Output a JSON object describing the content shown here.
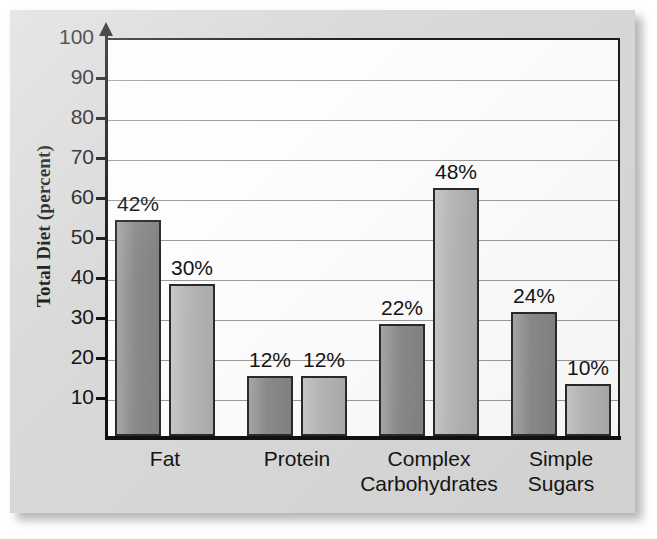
{
  "figure": {
    "background_color": "#d9d9d9",
    "plot_background_color": "#fdfdfd",
    "axis_color": "#111111",
    "grid_color": "#9a9a9a"
  },
  "chart_data": {
    "type": "bar",
    "title": "",
    "xlabel": "",
    "ylabel": "Total Diet (percent)",
    "ylim": [
      0,
      100
    ],
    "yticks": [
      10,
      20,
      30,
      40,
      50,
      60,
      70,
      80,
      90,
      100
    ],
    "ytick_labels": [
      "10",
      "20",
      "30",
      "40",
      "50",
      "60",
      "70",
      "80",
      "90",
      "100"
    ],
    "grid": true,
    "legend": "none",
    "categories": [
      "Fat",
      "Protein",
      "Complex Carbohydrates",
      "Simple Sugars"
    ],
    "series": [
      {
        "name": "Series 1",
        "color": "#8a8a8a",
        "values": [
          42,
          12,
          22,
          24
        ],
        "data_labels": [
          "42%",
          "30%",
          "12%",
          "12%",
          "22%",
          "48%",
          "24%",
          "10%"
        ],
        "drawn_bar_tops": [
          54,
          15,
          28,
          31
        ]
      },
      {
        "name": "Series 2",
        "color": "#b6b6b6",
        "values": [
          30,
          12,
          48,
          10
        ],
        "drawn_bar_tops": [
          38,
          15,
          62,
          13
        ]
      }
    ],
    "bars": [
      {
        "group": "Fat",
        "series": 1,
        "label": "42%",
        "value": 42,
        "drawn_top": 54,
        "x": 105,
        "width": 46,
        "color": "#8a8a8a"
      },
      {
        "group": "Fat",
        "series": 2,
        "label": "30%",
        "value": 30,
        "drawn_top": 38,
        "x": 159,
        "width": 46,
        "color": "#b6b6b6"
      },
      {
        "group": "Protein",
        "series": 1,
        "label": "12%",
        "value": 12,
        "drawn_top": 15,
        "x": 237,
        "width": 46,
        "color": "#8a8a8a"
      },
      {
        "group": "Protein",
        "series": 2,
        "label": "12%",
        "value": 12,
        "drawn_top": 15,
        "x": 291,
        "width": 46,
        "color": "#b6b6b6"
      },
      {
        "group": "Complex Carbohydrates",
        "series": 1,
        "label": "22%",
        "value": 22,
        "drawn_top": 28,
        "x": 369,
        "width": 46,
        "color": "#8a8a8a"
      },
      {
        "group": "Complex Carbohydrates",
        "series": 2,
        "label": "48%",
        "value": 48,
        "drawn_top": 62,
        "x": 423,
        "width": 46,
        "color": "#b6b6b6"
      },
      {
        "group": "Simple Sugars",
        "series": 1,
        "label": "24%",
        "value": 24,
        "drawn_top": 31,
        "x": 501,
        "width": 46,
        "color": "#8a8a8a"
      },
      {
        "group": "Simple Sugars",
        "series": 2,
        "label": "10%",
        "value": 10,
        "drawn_top": 13,
        "x": 555,
        "width": 46,
        "color": "#b6b6b6"
      }
    ],
    "category_label_positions": [
      {
        "label": "Fat",
        "center": 155
      },
      {
        "label": "Protein",
        "center": 287
      },
      {
        "label": "Complex\nCarbohydrates",
        "center": 419
      },
      {
        "label": "Simple\nSugars",
        "center": 551
      }
    ]
  }
}
